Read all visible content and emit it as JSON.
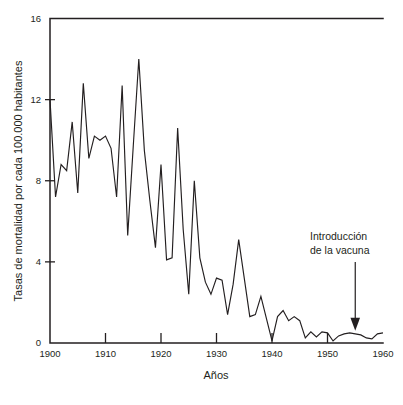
{
  "chart_data": {
    "type": "line",
    "title": "",
    "subtitle": "",
    "xlabel": "Años",
    "ylabel": "Tasas de mortalidad por cada 100.000 habitantes",
    "xlim": [
      1900,
      1960
    ],
    "ylim": [
      0,
      16
    ],
    "xticks": [
      1900,
      1910,
      1920,
      1930,
      1940,
      1950,
      1960
    ],
    "xticklabels": [
      "1900",
      "1910",
      "1920",
      "1930",
      "1940",
      "1950",
      "1960"
    ],
    "yticks": [
      0,
      4,
      8,
      12,
      16
    ],
    "yticklabels": [
      "0",
      "4",
      "8",
      "12",
      "16"
    ],
    "grid": false,
    "legend": null,
    "line_color": "#231f20",
    "x": [
      1900,
      1901,
      1902,
      1903,
      1904,
      1905,
      1906,
      1907,
      1908,
      1909,
      1910,
      1911,
      1912,
      1913,
      1914,
      1915,
      1916,
      1917,
      1918,
      1919,
      1920,
      1921,
      1922,
      1923,
      1924,
      1925,
      1926,
      1927,
      1928,
      1929,
      1930,
      1931,
      1932,
      1933,
      1934,
      1935,
      1936,
      1937,
      1938,
      1939,
      1940,
      1941,
      1942,
      1943,
      1944,
      1945,
      1946,
      1947,
      1948,
      1949,
      1950,
      1951,
      1952,
      1953,
      1954,
      1955,
      1956,
      1957,
      1958,
      1959,
      1960
    ],
    "values": [
      12.0,
      7.2,
      8.8,
      8.5,
      10.9,
      7.4,
      12.8,
      9.1,
      10.2,
      10.0,
      10.2,
      9.6,
      7.2,
      12.7,
      5.3,
      9.7,
      14.0,
      9.5,
      7.0,
      4.7,
      8.8,
      4.1,
      4.2,
      10.6,
      5.6,
      2.4,
      8.0,
      4.2,
      3.0,
      2.4,
      3.2,
      3.1,
      1.4,
      2.9,
      5.1,
      3.2,
      1.3,
      1.4,
      2.3,
      1.2,
      0.1,
      1.3,
      1.6,
      1.1,
      1.3,
      1.1,
      0.25,
      0.55,
      0.3,
      0.55,
      0.5,
      0.1,
      0.35,
      0.45,
      0.5,
      0.45,
      0.4,
      0.25,
      0.2,
      0.45,
      0.5
    ],
    "annotations": [
      {
        "name": "vaccine-introduction",
        "text_line_1": "Introducción",
        "text_line_2": "de la vacuna",
        "arrow_x": 1955,
        "arrow_points_to_y": 0.6
      }
    ]
  },
  "axis": {
    "y_title": "Tasas de mortalidad por cada 100.000 habitantes",
    "x_title": "Años"
  }
}
